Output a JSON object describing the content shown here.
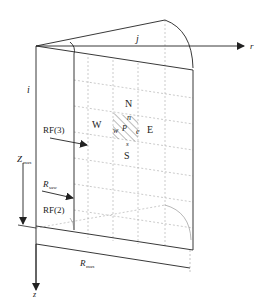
{
  "diagram": {
    "type": "cylindrical-sector-grid",
    "axes": {
      "r": "r",
      "z": "z",
      "i": "i",
      "j": "j"
    },
    "dimensions": {
      "z_max": {
        "main": "Z",
        "sub": "max"
      },
      "r_max": {
        "main": "R",
        "sub": "max"
      },
      "r_saw": {
        "main": "R",
        "sub": "saw"
      }
    },
    "boundaries": {
      "rf3": "RF(3)",
      "rf2": "RF(2)"
    },
    "cell_neighbors": {
      "north": "N",
      "south": "S",
      "east": "E",
      "west": "W"
    },
    "cell_faces": {
      "n": "n",
      "s": "s",
      "e": "e",
      "w": "w",
      "p": "P"
    },
    "colors": {
      "line": "#222222",
      "grid": "#9a9a9a",
      "hatch": "#555555"
    }
  }
}
